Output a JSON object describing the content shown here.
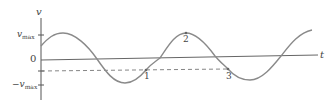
{
  "diagram": {
    "type": "sinusoidal velocity-time graph",
    "axes": {
      "vertical_label": "v",
      "horizontal_label": "t",
      "ticks": [
        {
          "label_main": "v",
          "label_sub": "max",
          "prefix": "",
          "y": 35
        },
        {
          "label_main": "0",
          "label_sub": "",
          "prefix": "",
          "y": 59
        },
        {
          "label_main": "v",
          "label_sub": "max",
          "prefix": "−",
          "y": 85
        }
      ]
    },
    "points": [
      {
        "label": "1",
        "x": 146,
        "y": 70
      },
      {
        "label": "2",
        "x": 186,
        "y": 33
      },
      {
        "label": "3",
        "x": 228,
        "y": 69
      }
    ],
    "dashed_line_y": 71,
    "colors": {
      "axis": "#555555",
      "curve": "#8a8a8a",
      "dashed": "#777777",
      "text": "#444444"
    }
  }
}
